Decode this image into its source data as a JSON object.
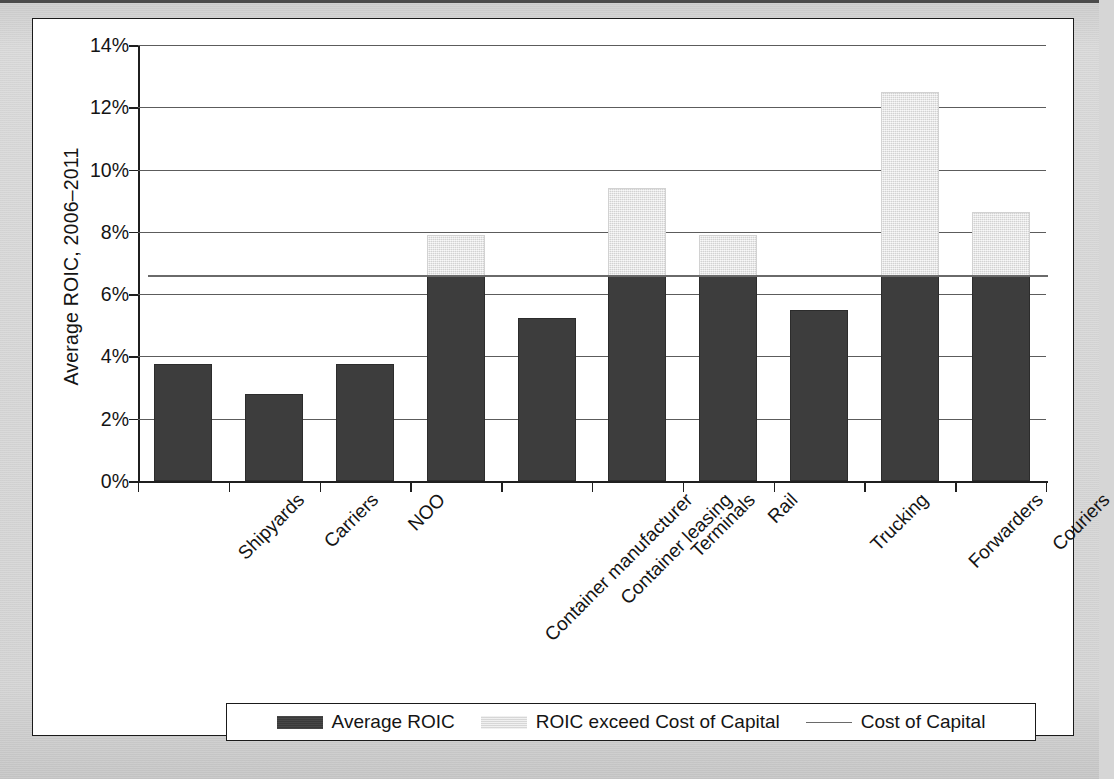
{
  "figure": {
    "background_color": "#ffffff",
    "page_color": "#d6d6d6",
    "border_color": "#1a1a1a"
  },
  "axes": {
    "y_axis_title": "Average ROIC, 2006–2011",
    "y_tick_labels": [
      "14%",
      "12%",
      "10%",
      "8%",
      "6%",
      "4%",
      "2%",
      "0%"
    ],
    "y_tick_values": [
      14,
      12,
      10,
      8,
      6,
      4,
      2,
      0
    ],
    "y_min": 0,
    "y_max": 14,
    "x_axis_title": ""
  },
  "legend": {
    "position": "bottom",
    "items": [
      {
        "label": "Average ROIC",
        "marker": "dark-square-swatch",
        "color": "#3d3d3d"
      },
      {
        "label": "ROIC exceed Cost of Capital",
        "marker": "light-square-swatch",
        "color": "#e2e2e2"
      },
      {
        "label": "Cost of Capital",
        "marker": "line-swatch",
        "color": "#6a6a6a"
      }
    ]
  },
  "chart_data": {
    "type": "bar",
    "subtype": "stacked-bar-with-reference-line",
    "title": "",
    "xlabel": "",
    "ylabel": "Average ROIC, 2006–2011",
    "ylim": [
      0,
      14
    ],
    "y_tick_step": 2,
    "y_unit": "%",
    "grid": "horizontal",
    "legend_position": "bottom",
    "categories": [
      "Shipyards",
      "Carriers",
      "NOO",
      "Container manufacturer",
      "Container leasing",
      "Terminals",
      "Rail",
      "Trucking",
      "Forwarders",
      "Couriers"
    ],
    "series": [
      {
        "name": "Average ROIC",
        "color": "#3d3d3d",
        "values": [
          3.75,
          2.8,
          3.75,
          6.6,
          5.25,
          6.6,
          6.6,
          5.5,
          6.6,
          6.6
        ]
      },
      {
        "name": "ROIC exceed Cost of Capital",
        "color": "#e2e2e2",
        "values": [
          0,
          0,
          0,
          1.3,
          0,
          2.8,
          1.3,
          0,
          5.9,
          2.05
        ]
      }
    ],
    "totals": [
      3.75,
      2.8,
      3.75,
      7.9,
      5.25,
      9.4,
      7.9,
      5.5,
      12.5,
      8.65
    ],
    "reference_line": {
      "name": "Cost of Capital",
      "value": 6.6,
      "color": "#6a6a6a"
    }
  }
}
